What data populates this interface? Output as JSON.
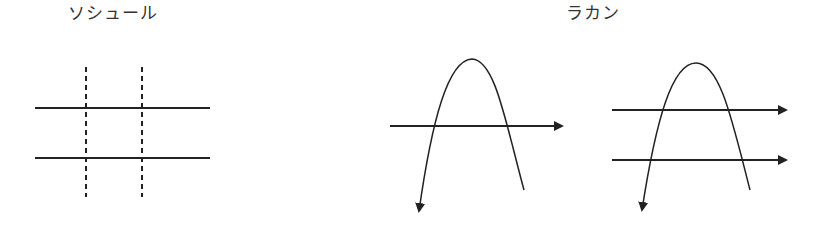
{
  "labels": {
    "saussure": "ソシュール",
    "lacan": "ラカン"
  },
  "colors": {
    "stroke": "#222222",
    "text": "#333333",
    "background": "#ffffff"
  },
  "diagrams": [
    {
      "name": "saussure-grid",
      "title_ref": "labels.saussure",
      "solid_horizontal_lines": 2,
      "dashed_vertical_lines": 2
    },
    {
      "name": "lacan-single-quilting-point",
      "title_ref": "labels.lacan",
      "horizontal_arrows": 1,
      "curve": "inverted-U with arrowhead on left end"
    },
    {
      "name": "lacan-double-quilting-point",
      "title_ref": "labels.lacan",
      "horizontal_arrows": 2,
      "curve": "inverted-U with arrowhead on left end"
    }
  ]
}
